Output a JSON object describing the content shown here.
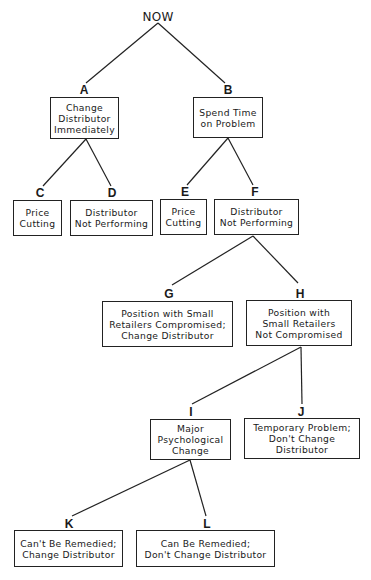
{
  "diagram": {
    "type": "decision-tree",
    "root": {
      "label": "NOW",
      "x": 158,
      "y": 10
    },
    "nodes": [
      {
        "id": "A",
        "text": "Change\nDistributor\nImmediately",
        "box": [
          50,
          97,
          69,
          42
        ],
        "letter_xy": [
          84,
          84
        ],
        "anchor_top": [
          84,
          84
        ],
        "anchor_bottom": [
          86,
          139
        ]
      },
      {
        "id": "B",
        "text": "Spend Time\non Problem",
        "box": [
          193,
          97,
          70,
          41
        ],
        "letter_xy": [
          228,
          84
        ],
        "anchor_top": [
          226,
          84
        ],
        "anchor_bottom": [
          228,
          138
        ]
      },
      {
        "id": "C",
        "text": "Price\nCutting",
        "box": [
          13,
          200,
          49,
          36
        ],
        "letter_xy": [
          40,
          187
        ],
        "anchor_top": [
          42,
          187
        ]
      },
      {
        "id": "D",
        "text": "Distributor\nNot Performing",
        "box": [
          70,
          200,
          83,
          36
        ],
        "letter_xy": [
          112,
          187
        ],
        "anchor_top": [
          111,
          187
        ]
      },
      {
        "id": "E",
        "text": "Price\nCutting",
        "box": [
          160,
          199,
          47,
          36
        ],
        "letter_xy": [
          185,
          186
        ],
        "anchor_top": [
          186,
          186
        ]
      },
      {
        "id": "F",
        "text": "Distributor\nNot Performing",
        "box": [
          214,
          199,
          85,
          36
        ],
        "letter_xy": [
          255,
          186
        ],
        "anchor_top": [
          253,
          186
        ],
        "anchor_bottom": [
          253,
          235
        ]
      },
      {
        "id": "G",
        "text": "Position with Small\nRetailers Compromised;\nChange Distributor",
        "box": [
          102,
          301,
          131,
          46
        ],
        "letter_xy": [
          169,
          288
        ],
        "anchor_top": [
          172,
          285
        ]
      },
      {
        "id": "H",
        "text": "Position with\nSmall Retailers\nNot Compromised",
        "box": [
          246,
          300,
          106,
          46
        ],
        "letter_xy": [
          300,
          288
        ],
        "anchor_top": [
          298,
          283
        ],
        "anchor_bottom": [
          301,
          346
        ]
      },
      {
        "id": "I",
        "text": "Major\nPsychological\nChange",
        "box": [
          150,
          419,
          81,
          41
        ],
        "letter_xy": [
          191,
          406
        ],
        "anchor_top": [
          192,
          404
        ],
        "anchor_bottom": [
          190,
          460
        ]
      },
      {
        "id": "J",
        "text": "Temporary Problem;\nDon't Change\nDistributor",
        "box": [
          244,
          418,
          116,
          41
        ],
        "letter_xy": [
          301,
          406
        ],
        "anchor_top": [
          302,
          404
        ]
      },
      {
        "id": "K",
        "text": "Can't Be Remedied;\nChange Distributor",
        "box": [
          14,
          530,
          109,
          37
        ],
        "letter_xy": [
          69,
          518
        ],
        "anchor_top": [
          72,
          516
        ]
      },
      {
        "id": "L",
        "text": "Can Be Remedied;\nDon't Change Distributor",
        "box": [
          136,
          530,
          139,
          37
        ],
        "letter_xy": [
          207,
          518
        ],
        "anchor_top": [
          206,
          516
        ]
      }
    ],
    "edges": [
      {
        "from": "NOW",
        "to": "A",
        "x1": 158,
        "y1": 23,
        "x2": 86,
        "y2": 83
      },
      {
        "from": "NOW",
        "to": "B",
        "x1": 158,
        "y1": 23,
        "x2": 225,
        "y2": 83
      },
      {
        "from": "A",
        "to": "C",
        "x1": 86,
        "y1": 139,
        "x2": 43,
        "y2": 186
      },
      {
        "from": "A",
        "to": "D",
        "x1": 86,
        "y1": 139,
        "x2": 111,
        "y2": 186
      },
      {
        "from": "B",
        "to": "E",
        "x1": 228,
        "y1": 138,
        "x2": 187,
        "y2": 185
      },
      {
        "from": "B",
        "to": "F",
        "x1": 228,
        "y1": 138,
        "x2": 253,
        "y2": 185
      },
      {
        "from": "F",
        "to": "G",
        "x1": 253,
        "y1": 236,
        "x2": 172,
        "y2": 285
      },
      {
        "from": "F",
        "to": "H",
        "x1": 253,
        "y1": 236,
        "x2": 298,
        "y2": 283
      },
      {
        "from": "H",
        "to": "I",
        "x1": 301,
        "y1": 347,
        "x2": 192,
        "y2": 404
      },
      {
        "from": "H",
        "to": "J",
        "x1": 301,
        "y1": 347,
        "x2": 302,
        "y2": 404
      },
      {
        "from": "I",
        "to": "K",
        "x1": 190,
        "y1": 460,
        "x2": 72,
        "y2": 516
      },
      {
        "from": "I",
        "to": "L",
        "x1": 190,
        "y1": 460,
        "x2": 206,
        "y2": 516
      }
    ],
    "colors": {
      "line": "#222222",
      "text": "#1a1a1a",
      "background": "#ffffff"
    }
  }
}
